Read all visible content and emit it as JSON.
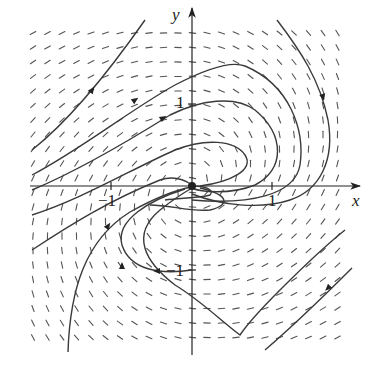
{
  "diagram": {
    "type": "phase-portrait",
    "axes": {
      "x_label": "x",
      "y_label": "y",
      "x_ticks": [
        {
          "value": -1,
          "label": "−1"
        },
        {
          "value": 1,
          "label": "1"
        }
      ],
      "y_ticks": [
        {
          "value": 1,
          "label": "1"
        },
        {
          "value": -1,
          "label": "−1"
        }
      ],
      "origin_px": [
        192,
        186
      ],
      "unit_px_x": 80,
      "unit_px_y": 83
    },
    "colors": {
      "axis": "#333333",
      "trajectory": "#3a3a3a",
      "field": "#555555",
      "background": "#ffffff"
    },
    "equilibrium": {
      "x": 0,
      "y": 0,
      "kind": "spiral sink"
    }
  }
}
